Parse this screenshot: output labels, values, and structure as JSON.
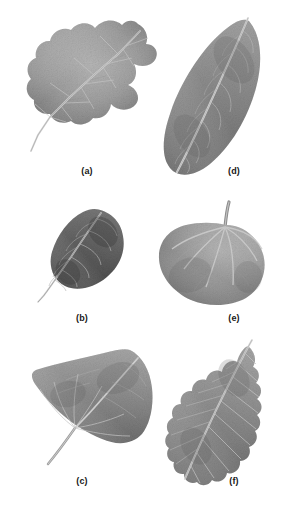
{
  "figure": {
    "background_color": "#ffffff",
    "width": 283,
    "height": 516,
    "layout": "2 columns x 3 rows grid of grayscale leaf photographs",
    "top_cropped_text": ""
  },
  "panels": [
    {
      "id": "a",
      "caption": "(a)",
      "caption_x": 87,
      "caption_y": 166,
      "leaf_type": "lobed oak leaf",
      "description": "Grayscale photograph of a deeply lobed oak leaf with rounded lobes, angled diagonally with petiole toward lower left",
      "venation": "pinnate",
      "margin": "lobed",
      "tone": "#9a9a9a",
      "box": {
        "x": 22,
        "y": 14,
        "w": 140,
        "h": 148
      }
    },
    {
      "id": "b",
      "caption": "(b)",
      "caption_x": 82,
      "caption_y": 313,
      "leaf_type": "ovate leaf",
      "description": "Dark grayscale photograph of a smooth-margined ovate leaf with prominent parallel secondary veins, petiole toward lower left",
      "venation": "pinnate",
      "margin": "entire",
      "tone": "#6b6b6b",
      "box": {
        "x": 31,
        "y": 204,
        "w": 103,
        "h": 101
      }
    },
    {
      "id": "c",
      "caption": "(c)",
      "caption_x": 82,
      "caption_y": 476,
      "leaf_type": "deltoid poplar leaf",
      "description": "Grayscale photograph of a triangular deltoid leaf with a long slender petiole extending down to the lower left",
      "venation": "pinnate",
      "margin": "finely serrate",
      "tone": "#8d8d8d",
      "box": {
        "x": 26,
        "y": 344,
        "w": 132,
        "h": 128
      }
    },
    {
      "id": "d",
      "caption": "(d)",
      "caption_x": 234,
      "caption_y": 166,
      "leaf_type": "elongated elliptic leaf",
      "description": "Grayscale photograph of a long narrow elliptical leaf with a pale prominent midrib, tilted with tip toward upper right",
      "venation": "pinnate",
      "margin": "entire",
      "tone": "#8a8a8a",
      "box": {
        "x": 148,
        "y": 12,
        "w": 122,
        "h": 170
      }
    },
    {
      "id": "e",
      "caption": "(e)",
      "caption_x": 234,
      "caption_y": 313,
      "leaf_type": "cordate round leaf",
      "description": "Grayscale photograph of a nearly circular heart-shaped leaf with palmate veins radiating from a petiole at the top right",
      "venation": "palmate",
      "margin": "entire",
      "tone": "#9b9b9b",
      "box": {
        "x": 150,
        "y": 197,
        "w": 120,
        "h": 112
      }
    },
    {
      "id": "f",
      "caption": "(f)",
      "caption_x": 234,
      "caption_y": 476,
      "leaf_type": "serrated elm leaf",
      "description": "Grayscale photograph of an elongated leaf with strongly scalloped serrate margins and straight parallel lateral veins, tip toward upper right",
      "venation": "pinnate",
      "margin": "coarsely serrate",
      "tone": "#8f8f8f",
      "box": {
        "x": 160,
        "y": 338,
        "w": 110,
        "h": 150
      }
    }
  ]
}
